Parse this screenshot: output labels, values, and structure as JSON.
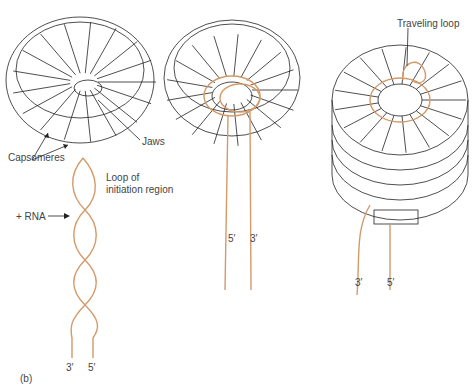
{
  "figure": {
    "panel_label": "(b)",
    "colors": {
      "rna": "#d49a6a",
      "outline": "#222222",
      "text": "#444444"
    },
    "panel1": {
      "labels": {
        "capsomeres": "Capsomeres",
        "jaws": "Jaws",
        "loop_line1": "Loop of",
        "loop_line2": "initiation region",
        "rna": "+ RNA",
        "end_left": "3′",
        "end_right": "5′"
      }
    },
    "panel2": {
      "labels": {
        "end_left": "5′",
        "end_right": "3′"
      }
    },
    "panel3": {
      "labels": {
        "traveling_loop": "Traveling loop",
        "end_left": "3′",
        "end_right": "5′"
      }
    }
  }
}
